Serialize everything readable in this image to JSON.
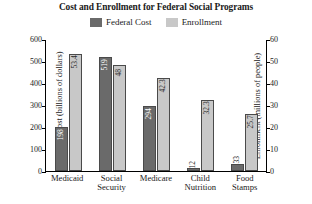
{
  "chart_data": {
    "type": "bar",
    "title": "Cost and Enrollment for Federal Social Programs",
    "categories": [
      "Medicaid",
      "Social Security",
      "Medicare",
      "Child Nutrition",
      "Food Stamps"
    ],
    "series": [
      {
        "name": "Federal Cost",
        "axis": "left",
        "color": "#6a6a6a",
        "values": [
          198,
          519,
          294,
          12,
          33
        ],
        "labels": [
          "198",
          "519",
          "294",
          "12",
          "33"
        ]
      },
      {
        "name": "Enrollment",
        "axis": "right",
        "color": "#c8c8c8",
        "values": [
          53.4,
          48,
          42.3,
          32.3,
          25.7
        ],
        "labels": [
          "53.4",
          "48",
          "42.3",
          "32.3",
          "25.7"
        ]
      }
    ],
    "xlabel": "",
    "ylabel": "Federal Cost (billions of dollars)",
    "y2label": "Enrollment (millions of people)",
    "ylim": [
      0,
      600
    ],
    "y2lim": [
      0,
      60
    ],
    "yticks": [
      "0",
      "100",
      "200",
      "300",
      "400",
      "500",
      "600"
    ],
    "y2ticks": [
      "0",
      "10",
      "20",
      "30",
      "40",
      "50",
      "60"
    ],
    "grid": false,
    "legend_position": "top-center"
  },
  "legend": {
    "entries": [
      {
        "label": "Federal Cost",
        "color": "#6a6a6a"
      },
      {
        "label": "Enrollment",
        "color": "#c8c8c8"
      }
    ]
  }
}
